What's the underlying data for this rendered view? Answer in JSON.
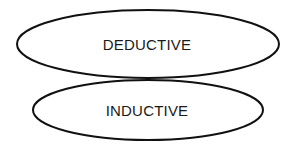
{
  "diagram": {
    "type": "venn-overlapping-ellipses",
    "background_color": "#ffffff",
    "stroke_color": "#111111",
    "fill_color": "#ffffff",
    "stroke_width": 2,
    "text_color": "#1a1a1a",
    "shapes": [
      {
        "id": "upper",
        "shape": "ellipse",
        "label": "DEDUCTIVE",
        "cx": 148,
        "cy": 44,
        "rx": 131,
        "ry": 34
      },
      {
        "id": "lower",
        "shape": "ellipse",
        "label": "INDUCTIVE",
        "cx": 148,
        "cy": 110,
        "rx": 115,
        "ry": 30
      }
    ]
  }
}
